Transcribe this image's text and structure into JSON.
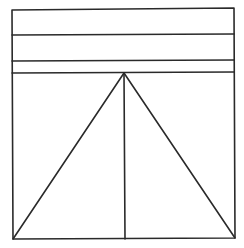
{
  "diagram": {
    "width": 244,
    "height": 248,
    "background": "#ffffff",
    "stroke_color": "#2a2a2a",
    "stroke_width": 1.6,
    "outer_frame": {
      "top_left": [
        12,
        10
      ],
      "top_right": [
        234,
        8
      ],
      "bottom_right": [
        235,
        238
      ],
      "bottom_left": [
        13,
        239
      ]
    },
    "horizontal_bands": [
      {
        "name": "band-line-1",
        "from": [
          12,
          35
        ],
        "to": [
          234,
          34
        ]
      },
      {
        "name": "band-line-2",
        "from": [
          12,
          61
        ],
        "to": [
          234,
          60
        ]
      },
      {
        "name": "band-line-3",
        "from": [
          12,
          73
        ],
        "to": [
          234,
          72
        ]
      }
    ],
    "triangle": {
      "apex": [
        124,
        73
      ],
      "base_left": [
        13,
        239
      ],
      "base_right": [
        235,
        238
      ]
    },
    "center_line": {
      "from": [
        124,
        73
      ],
      "to": [
        125,
        239
      ]
    }
  }
}
